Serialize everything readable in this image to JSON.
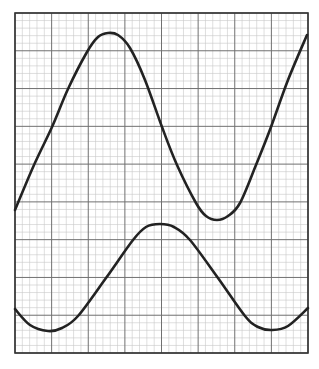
{
  "chart_data": {
    "type": "line",
    "title": "",
    "xlabel": "",
    "ylabel": "",
    "grid": true,
    "grid_major": {
      "columns": 8,
      "rows": 9,
      "minor_per_major": 5
    },
    "xlim": [
      0,
      8
    ],
    "ylim": [
      0,
      9
    ],
    "plot_px": {
      "left": 15,
      "top": 13,
      "right": 308,
      "bottom": 353
    },
    "colors": {
      "background": "#ffffff",
      "minor_grid": "#c8c8c8",
      "major_grid": "#707070",
      "frame": "#333333",
      "curve": "#222222"
    },
    "series": [
      {
        "name": "upper-curve",
        "points_px": [
          [
            15,
            210
          ],
          [
            34,
            165
          ],
          [
            52,
            127
          ],
          [
            68,
            89
          ],
          [
            87,
            52
          ],
          [
            98,
            37
          ],
          [
            108,
            33
          ],
          [
            118,
            35
          ],
          [
            130,
            48
          ],
          [
            145,
            80
          ],
          [
            162,
            127
          ],
          [
            177,
            165
          ],
          [
            196,
            203
          ],
          [
            206,
            216
          ],
          [
            217,
            220
          ],
          [
            228,
            216
          ],
          [
            240,
            203
          ],
          [
            256,
            165
          ],
          [
            271,
            127
          ],
          [
            288,
            80
          ],
          [
            307,
            35
          ]
        ]
      },
      {
        "name": "lower-curve",
        "points_px": [
          [
            15,
            309
          ],
          [
            30,
            325
          ],
          [
            48,
            331
          ],
          [
            62,
            328
          ],
          [
            78,
            316
          ],
          [
            106,
            278
          ],
          [
            133,
            240
          ],
          [
            146,
            227
          ],
          [
            160,
            224
          ],
          [
            174,
            227
          ],
          [
            190,
            240
          ],
          [
            218,
            278
          ],
          [
            245,
            316
          ],
          [
            258,
            327
          ],
          [
            272,
            330
          ],
          [
            288,
            326
          ],
          [
            308,
            308
          ]
        ]
      }
    ]
  }
}
